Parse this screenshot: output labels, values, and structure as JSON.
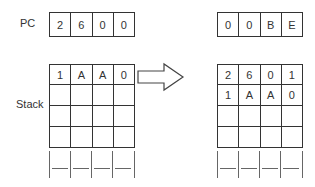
{
  "before": {
    "pc_label": "PC",
    "pc": [
      "2",
      "6",
      "0",
      "0"
    ],
    "stack_label": "Stack",
    "stack": [
      [
        "1",
        "A",
        "A",
        "0"
      ],
      [
        "",
        "",
        "",
        ""
      ],
      [
        "",
        "",
        "",
        ""
      ],
      [
        "",
        "",
        "",
        ""
      ]
    ]
  },
  "after": {
    "pc": [
      "0",
      "0",
      "B",
      "E"
    ],
    "stack": [
      [
        "2",
        "6",
        "0",
        "1"
      ],
      [
        "1",
        "A",
        "A",
        "0"
      ],
      [
        "",
        "",
        "",
        ""
      ],
      [
        "",
        "",
        "",
        ""
      ]
    ]
  },
  "arrow": "transition-arrow-right"
}
